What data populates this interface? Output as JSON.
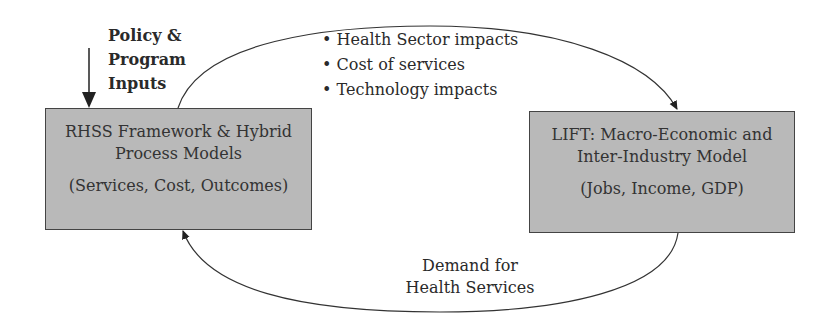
{
  "inputs": {
    "label_lines": [
      "Policy &",
      "Program",
      "Inputs"
    ]
  },
  "left_box": {
    "title_line1": "RHSS Framework & Hybrid",
    "title_line2": "Process Models",
    "subtitle": "(Services, Cost, Outcomes)"
  },
  "right_box": {
    "title_line1": "LIFT: Macro-Economic and",
    "title_line2": "Inter-Industry Model",
    "subtitle": "(Jobs, Income, GDP)"
  },
  "top_flow": {
    "items": [
      "Health Sector impacts",
      "Cost of services",
      "Technology impacts"
    ]
  },
  "bottom_flow": {
    "label_line1": "Demand for",
    "label_line2": "Health Services"
  },
  "colors": {
    "box_fill": "#b9b9b9",
    "line": "#333333"
  }
}
